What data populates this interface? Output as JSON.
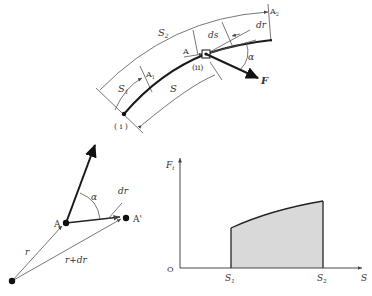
{
  "diagram": {
    "top_figure": {
      "description": "Particle moving along curved path from point (i) to (ii) with force F acting at angle α",
      "labels": {
        "s2": "S",
        "s2_sub": "2",
        "s1": "S",
        "s1_sub": "1",
        "s": "S",
        "ds": "ds",
        "dr": "dr",
        "alpha": "α",
        "force": "F",
        "a": "A",
        "a1": "A",
        "a1_sub": "1",
        "a2": "A",
        "a2_sub": "2",
        "point_i": "( i )",
        "point_ii": "(ii)"
      }
    },
    "left_figure": {
      "description": "Vector displacement from A to A' with position vectors r and r+dr",
      "labels": {
        "a": "A",
        "a_prime": "A'",
        "alpha": "α",
        "dr": "dr",
        "r": "r",
        "r_dr": "r+dr"
      }
    },
    "right_figure": {
      "description": "Tangential force component Ft vs arc length S; shaded area equals work done",
      "labels": {
        "y_axis": "F",
        "y_axis_sub": "t",
        "x_axis": "S",
        "origin": "O",
        "s1": "S",
        "s1_sub": "1",
        "s2": "S",
        "s2_sub": "2"
      },
      "fill_color": "#d9d9d9"
    }
  }
}
